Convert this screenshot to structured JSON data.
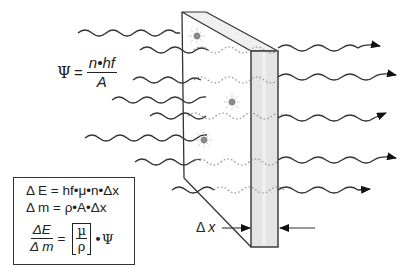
{
  "figure": {
    "slab": {
      "front_face_color": "#ffffff",
      "side_face_color": "#e6e6e6",
      "top_face_color": "#efefef",
      "edge_color": "#333333"
    },
    "incoming_waves": 8,
    "transmitted_waves": 5,
    "absorption_sites": 3,
    "absorption_site_color": "#8a8a8a",
    "wave_color": "#333333"
  },
  "equations": {
    "psi": {
      "lhs": "Ψ",
      "equals": "=",
      "numerator": "n•hf",
      "denominator": "A"
    },
    "box": {
      "line1_lhs": "Δ E",
      "line1_rhs": "= hf•μ•n•Δx",
      "line2_lhs": "Δ m",
      "line2_rhs": "= ρ•A•Δx",
      "line3_num": "ΔE",
      "line3_den": "Δ m",
      "line3_equals": "=",
      "line3_bracket_top": "μ",
      "line3_bracket_bottom": "ρ",
      "line3_tail": "•Ψ"
    }
  },
  "labels": {
    "thickness": "Δ",
    "thickness_var": "x"
  }
}
